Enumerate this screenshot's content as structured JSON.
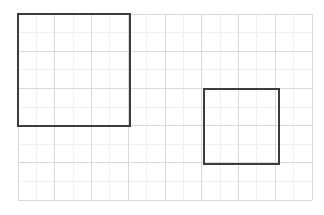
{
  "figure": {
    "title": "",
    "canvas": {
      "width": 324,
      "height": 215,
      "background_color": "#ffffff"
    },
    "grid": {
      "visible": true,
      "origin_x": 18,
      "origin_y": 14,
      "cell_width": 36.75,
      "cell_height": 37.2,
      "columns": 8,
      "rows": 5,
      "line_color": "#d9d9d9",
      "line_width": 1,
      "minor_line_color": "#f0f0f0",
      "minor_line_width": 1,
      "minor_divisions": 2
    },
    "shapes": [
      {
        "name": "large-square",
        "type": "square",
        "x": 18,
        "y": 14,
        "width": 112,
        "height": 112,
        "cells_wide": 3,
        "cells_tall": 3,
        "area_cells": 9,
        "stroke_color": "#3c3c3c",
        "stroke_width": 2,
        "fill": "none"
      },
      {
        "name": "small-square",
        "type": "square",
        "x": 204,
        "y": 89,
        "width": 75,
        "height": 75,
        "cells_wide": 2,
        "cells_tall": 2,
        "area_cells": 4,
        "stroke_color": "#3c3c3c",
        "stroke_width": 2,
        "fill": "none"
      }
    ]
  },
  "chart_data": {
    "type": "diagram",
    "title": "",
    "xlabel": "",
    "ylabel": "",
    "grid": true,
    "legend": null,
    "xlim": [
      0,
      8
    ],
    "ylim": [
      0,
      5
    ],
    "categories": [
      "large-square",
      "small-square"
    ],
    "values": [
      9,
      4
    ],
    "annotations": [
      "Large square: 3 by 3 grid cells, area 9 cells",
      "Small square: 2 by 2 grid cells, area 4 cells"
    ]
  }
}
